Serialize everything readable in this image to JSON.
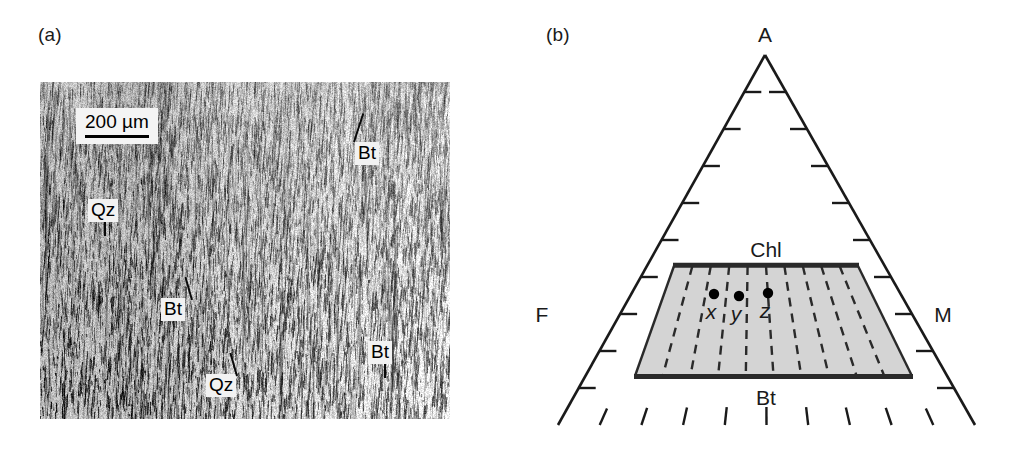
{
  "figure": {
    "panels": [
      {
        "key": "a",
        "letter": "(a)",
        "type": "photomicrograph"
      },
      {
        "key": "b",
        "letter": "(b)",
        "type": "ternary-diagram"
      }
    ]
  },
  "micrograph": {
    "letter": "(a)",
    "scale_bar": {
      "label": "200 µm",
      "bar_width_px": 96
    },
    "mineral_labels": [
      {
        "id": "bt-top",
        "text": "Bt",
        "x": 315,
        "y": 60,
        "leader": "up-left"
      },
      {
        "id": "qz-upper",
        "text": "Qz",
        "x": 48,
        "y": 117,
        "leader": "down"
      },
      {
        "id": "bt-middle",
        "text": "Bt",
        "x": 121,
        "y": 216,
        "leader": "up-right"
      },
      {
        "id": "qz-lower",
        "text": "Qz",
        "x": 166,
        "y": 292,
        "leader": "up-right"
      },
      {
        "id": "bt-right",
        "text": "Bt",
        "x": 328,
        "y": 259,
        "leader": "down"
      }
    ]
  },
  "ternary": {
    "letter": "(b)",
    "vertices": [
      {
        "id": "apex",
        "label": "A",
        "position": "top"
      },
      {
        "id": "left-corner",
        "label": "F",
        "position": "bottom-left"
      },
      {
        "id": "right-corner",
        "label": "M",
        "position": "bottom-right"
      }
    ],
    "field": {
      "name": "chlorite-biotite-field",
      "top_edge_label": "Chl",
      "bottom_edge_label": "Bt",
      "fill_color": "#d4d4d4",
      "edge_color": "#2a2a2a",
      "tie_line_style": "dashed",
      "tie_line_count": 9
    },
    "data_points": [
      {
        "id": "point-x",
        "label": "x",
        "cx": 194,
        "cy": 284
      },
      {
        "id": "point-y",
        "label": "y",
        "cx": 219,
        "cy": 286
      },
      {
        "id": "point-z",
        "label": "z",
        "cx": 248,
        "cy": 283
      }
    ],
    "axis_ticks": {
      "left_edge_count": 9,
      "right_edge_count": 9,
      "bottom_edge_count": 9,
      "tick_color": "#1a1a1a"
    }
  },
  "colors": {
    "ink": "#1a1a1a",
    "field_fill": "#d4d4d4",
    "field_stroke": "#2a2a2a",
    "label_background": "#f2f2f2",
    "page_background": "#ffffff"
  }
}
